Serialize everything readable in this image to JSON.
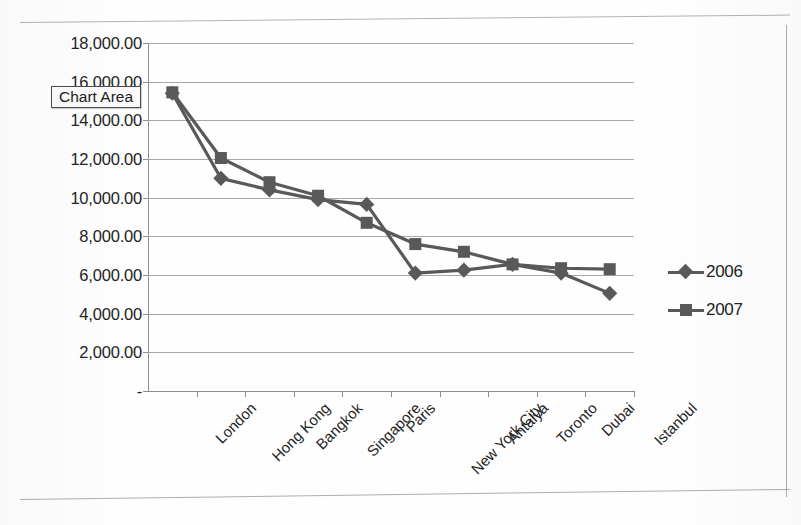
{
  "tooltip": {
    "label": "Chart Area"
  },
  "legend": {
    "position": "right",
    "items": [
      {
        "label": "2006",
        "marker": "diamond-marker-icon",
        "color": "#595959"
      },
      {
        "label": "2007",
        "marker": "square-marker-icon",
        "color": "#595959"
      }
    ]
  },
  "axes": {
    "y_tick_labels": [
      "18,000.00",
      "16,000.00",
      "14,000.00",
      "12,000.00",
      "10,000.00",
      "8,000.00",
      "6,000.00",
      "4,000.00",
      "2,000.00",
      "-"
    ],
    "x_tick_labels": [
      "London",
      "Hong Kong",
      "Bangkok",
      "Singapore",
      "Paris",
      "New York City",
      "Antalya",
      "Toronto",
      "Dubai",
      "Istanbul"
    ]
  },
  "chart_data": {
    "type": "line",
    "title": "",
    "xlabel": "",
    "ylabel": "",
    "ylim": [
      0,
      18000
    ],
    "ytick_step": 2000,
    "grid": true,
    "legend_position": "right",
    "categories": [
      "London",
      "Hong Kong",
      "Bangkok",
      "Singapore",
      "Paris",
      "New York City",
      "Antalya",
      "Toronto",
      "Dubai",
      "Istanbul"
    ],
    "series": [
      {
        "name": "2006",
        "marker": "diamond",
        "color": "#595959",
        "values": [
          15400,
          11000,
          10400,
          9900,
          9650,
          6100,
          6250,
          6550,
          6100,
          5050
        ]
      },
      {
        "name": "2007",
        "marker": "square",
        "color": "#595959",
        "values": [
          15450,
          12050,
          10800,
          10100,
          8700,
          7600,
          7200,
          6550,
          6350,
          6300
        ]
      }
    ]
  }
}
